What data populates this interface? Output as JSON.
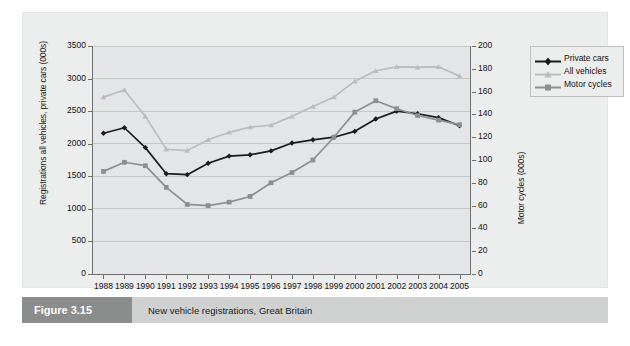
{
  "caption": {
    "tag": "Figure 3.15",
    "text": "New vehicle registrations, Great Britain"
  },
  "colors": {
    "private_cars": "#1a1a1a",
    "all_vehicles": "#bcbcbc",
    "motor_cycles": "#8e8e8e",
    "panel_background": "#eceded",
    "plot_background": "#e4e5e6",
    "gridline": "#c6c7c8",
    "axis": "#6e6f70",
    "caption_bar": "#cfd0d0",
    "caption_tag": "#8b8c8c"
  },
  "legend": {
    "position": "right",
    "items": [
      {
        "label": "Private cars",
        "color": "#1a1a1a",
        "marker": "diamond"
      },
      {
        "label": "All vehicles",
        "color": "#bcbcbc",
        "marker": "triangle"
      },
      {
        "label": "Motor cycles",
        "color": "#8e8e8e",
        "marker": "square"
      }
    ]
  },
  "chart_data": {
    "type": "line",
    "title": "New vehicle registrations, Great Britain",
    "xlabel": "",
    "ylabel": "Registrations all vehicles, private cars (000s)",
    "y2label": "Motor cycles (000s)",
    "grid": true,
    "x": [
      1988,
      1989,
      1990,
      1991,
      1992,
      1993,
      1994,
      1995,
      1996,
      1997,
      1998,
      1999,
      2000,
      2001,
      2002,
      2003,
      2004,
      2005
    ],
    "categories": [
      "1988",
      "1989",
      "1990",
      "1991",
      "1992",
      "1993",
      "1994",
      "1995",
      "1996",
      "1997",
      "1998",
      "1999",
      "2000",
      "2001",
      "2002",
      "2003",
      "2004",
      "2005"
    ],
    "ylim": [
      0,
      3500
    ],
    "yticks": [
      0,
      500,
      1000,
      1500,
      2000,
      2500,
      3000,
      3500
    ],
    "ytick_labels": [
      "0",
      "500",
      "1000",
      "1500",
      "2000",
      "2500",
      "3000",
      "3500"
    ],
    "y2lim": [
      0,
      200
    ],
    "y2ticks": [
      0,
      20,
      40,
      60,
      80,
      100,
      120,
      140,
      160,
      180,
      200
    ],
    "y2tick_labels": [
      "0",
      "20",
      "40",
      "60",
      "80",
      "100",
      "120",
      "140",
      "160",
      "180",
      "200"
    ],
    "series": [
      {
        "name": "Private cars",
        "axis": "left",
        "color": "#1a1a1a",
        "marker": "diamond",
        "values": [
          2160,
          2245,
          1940,
          1540,
          1525,
          1700,
          1810,
          1830,
          1890,
          2010,
          2060,
          2100,
          2190,
          2380,
          2500,
          2460,
          2400,
          2275
        ]
      },
      {
        "name": "All vehicles",
        "axis": "left",
        "color": "#bcbcbc",
        "marker": "triangle",
        "values": [
          2715,
          2825,
          2420,
          1915,
          1895,
          2060,
          2175,
          2255,
          2285,
          2420,
          2570,
          2715,
          2960,
          3120,
          3180,
          3175,
          3180,
          3040
        ]
      },
      {
        "name": "Motor cycles",
        "axis": "right",
        "color": "#8e8e8e",
        "marker": "square",
        "values": [
          90,
          98,
          95,
          76,
          61,
          60,
          63,
          68,
          80,
          89,
          100,
          120,
          142,
          152,
          145,
          139,
          135,
          131
        ]
      }
    ]
  }
}
